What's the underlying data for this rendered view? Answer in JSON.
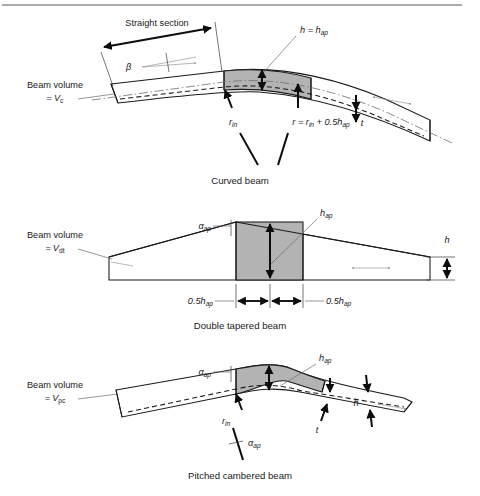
{
  "figure": {
    "title_rule": "top-divider-rule",
    "background_color": "#ffffff",
    "apex_fill_color": "#b3b3b3",
    "line_color": "#1a1a1a"
  },
  "panels": [
    {
      "id": "curved-beam",
      "caption": "Curved beam",
      "volume_label_line1": "Beam volume",
      "volume_label_line2_prefix": "=",
      "volume_symbol": "V",
      "volume_subscript": "c",
      "annotations": {
        "straight_section": "Straight section",
        "beta": "β",
        "h_equals": "h = h",
        "h_equals_sub": "ap",
        "r_in_symbol": "r",
        "r_in_sub": "in",
        "radius_expr_a": "r = r",
        "radius_expr_sub1": "in",
        "radius_expr_b": " + 0.5h",
        "radius_expr_sub2": "ap",
        "t_symbol": "t"
      }
    },
    {
      "id": "double-tapered-beam",
      "caption": "Double tapered beam",
      "volume_label_line1": "Beam volume",
      "volume_label_line2_prefix": "=",
      "volume_symbol": "V",
      "volume_subscript": "dt",
      "annotations": {
        "alpha_ap": "α",
        "alpha_ap_sub": "ap",
        "h_ap": "h",
        "h_ap_sub": "ap",
        "half_h_left": "0.5h",
        "half_h_left_sub": "ap",
        "half_h_right": "0.5h",
        "half_h_right_sub": "ap",
        "h_right": "h"
      }
    },
    {
      "id": "pitched-cambered-beam",
      "caption": "Pitched cambered beam",
      "volume_label_line1": "Beam volume",
      "volume_label_line2_prefix": "=",
      "volume_symbol": "V",
      "volume_subscript": "pc",
      "annotations": {
        "alpha_ap_top": "α",
        "alpha_ap_top_sub": "ap",
        "h_ap": "h",
        "h_ap_sub": "ap",
        "r_in_symbol": "r",
        "r_in_sub": "in",
        "alpha_ap_bottom": "α",
        "alpha_ap_bottom_sub": "ap",
        "t_symbol": "t",
        "h_symbol": "h"
      }
    }
  ]
}
